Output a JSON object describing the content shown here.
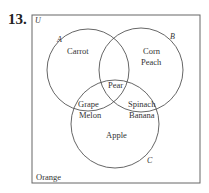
{
  "problem_number": "13.",
  "venn": {
    "universe_label": "U",
    "sets": [
      {
        "name": "A",
        "only": [
          "Carrot"
        ]
      },
      {
        "name": "B",
        "only": [
          "Corn",
          "Peach"
        ]
      },
      {
        "name": "C",
        "only": [
          "Apple"
        ]
      }
    ],
    "intersections": {
      "A_B_C": [
        "Pear"
      ],
      "A_C": [
        "Grape",
        "Melon"
      ],
      "B_C": [
        "Spinach",
        "Banana"
      ],
      "A_B": []
    },
    "outside": [
      "Orange"
    ]
  },
  "labels": {
    "U": "U",
    "A": "A",
    "B": "B",
    "C": "C",
    "carrot": "Carrot",
    "corn": "Corn",
    "peach": "Peach",
    "pear": "Pear",
    "grape": "Grape",
    "melon": "Melon",
    "spinach": "Spinach",
    "banana": "Banana",
    "apple": "Apple",
    "orange": "Orange"
  },
  "colors": {
    "line": "#555555",
    "text": "#333333"
  }
}
